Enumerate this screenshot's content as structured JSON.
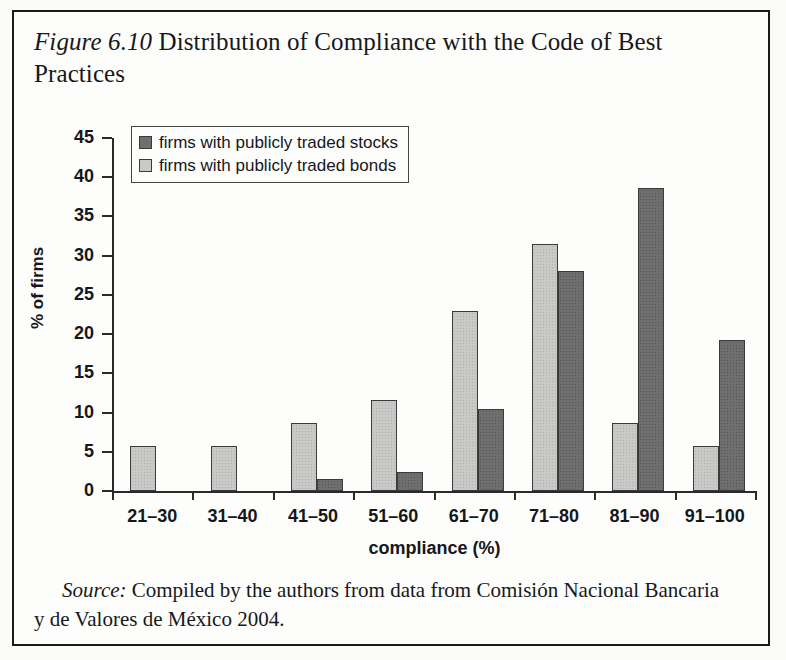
{
  "figure": {
    "label": "Figure 6.10",
    "title": "Distribution of Compliance with the Code of Best Practices",
    "source_label": "Source:",
    "source_text": "Compiled by the authors from data from Comisión Nacional Bancaria y de Valores de México 2004."
  },
  "legend": {
    "position": "upper-left-inside",
    "entries": [
      {
        "label": "firms with publicly traded stocks",
        "color": "#6f6f6f",
        "key": "stocks"
      },
      {
        "label": "firms with publicly traded bonds",
        "color": "#c9c9c7",
        "key": "bonds"
      }
    ]
  },
  "chart_data": {
    "type": "bar",
    "title": "Distribution of Compliance with the Code of Best Practices",
    "xlabel": "compliance (%)",
    "ylabel": "% of firms",
    "ylim": [
      0,
      45
    ],
    "yticks": [
      0,
      5,
      10,
      15,
      20,
      25,
      30,
      35,
      40,
      45
    ],
    "ytick_labels": [
      "0",
      "5",
      "10",
      "15",
      "20",
      "25",
      "30",
      "35",
      "40",
      "45"
    ],
    "grid": false,
    "categories": [
      "21–30",
      "31–40",
      "41–50",
      "51–60",
      "61–70",
      "71–80",
      "81–90",
      "91–100"
    ],
    "series": [
      {
        "name": "firms with publicly traded bonds",
        "color": "#c9c9c7",
        "values": [
          5.8,
          5.8,
          8.7,
          11.6,
          23.0,
          31.5,
          8.7,
          5.8
        ]
      },
      {
        "name": "firms with publicly traded stocks",
        "color": "#6f6f6f",
        "values": [
          0,
          0,
          1.5,
          2.4,
          10.4,
          28.1,
          38.6,
          19.3
        ]
      }
    ]
  }
}
